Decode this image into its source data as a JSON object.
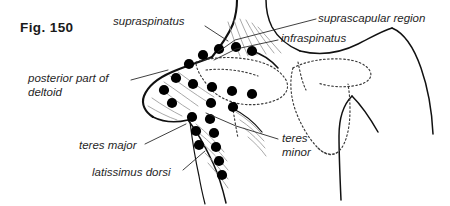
{
  "figure": {
    "caption": "Fig. 150",
    "style": {
      "ink": "#111111",
      "background": "#ffffff",
      "dot_color": "#000000",
      "muscle_fiber_color": "#8d8d8d",
      "dotted_outline_color": "#3a3a3a"
    }
  },
  "annotations": [
    {
      "id": "supraspinatus",
      "label": "supraspinatus",
      "lines": [
        "supraspinatus"
      ],
      "text_x": 113,
      "text_y": 15,
      "leader": [
        [
          205,
          26
        ],
        [
          228,
          41
        ]
      ]
    },
    {
      "id": "suprascapular-region",
      "label": "suprascapular region",
      "lines": [
        "suprascapular region"
      ],
      "text_x": 318,
      "text_y": 12,
      "leader": [
        [
          316,
          19
        ],
        [
          235,
          40
        ],
        [
          218,
          52
        ]
      ]
    },
    {
      "id": "infraspinatus",
      "label": "infraspinatus",
      "lines": [
        "infraspinatus"
      ],
      "text_x": 281,
      "text_y": 32,
      "leader": [
        [
          278,
          40
        ],
        [
          236,
          49
        ],
        [
          214,
          60
        ]
      ]
    },
    {
      "id": "posterior-part-of-deltoid",
      "label": "posterior part of deltoid",
      "lines": [
        "posterior part of",
        "deltoid"
      ],
      "text_x": 28,
      "text_y": 72,
      "leader": [
        [
          131,
          80
        ],
        [
          168,
          70
        ]
      ]
    },
    {
      "id": "teres-major",
      "label": "teres major",
      "lines": [
        "teres major"
      ],
      "text_x": 79,
      "text_y": 139,
      "leader": [
        [
          145,
          144
        ],
        [
          186,
          124
        ]
      ]
    },
    {
      "id": "latissimus-dorsi",
      "label": "latissimus dorsi",
      "lines": [
        "latissimus dorsi"
      ],
      "text_x": 92,
      "text_y": 166,
      "leader": [
        [
          183,
          170
        ],
        [
          205,
          151
        ]
      ]
    },
    {
      "id": "teres-minor",
      "label": "teres minor",
      "lines": [
        "teres",
        "minor"
      ],
      "text_x": 282,
      "text_y": 132,
      "leader": [
        [
          278,
          139
        ],
        [
          236,
          126
        ],
        [
          206,
          113
        ]
      ]
    }
  ],
  "trigger_points": {
    "radius": 5.1,
    "supraspinatus_row": [
      {
        "x": 189,
        "y": 64
      },
      {
        "x": 203,
        "y": 55
      },
      {
        "x": 219,
        "y": 49
      },
      {
        "x": 236,
        "y": 47
      },
      {
        "x": 252,
        "y": 51
      }
    ],
    "deltoid_cluster": [
      {
        "x": 176,
        "y": 78
      },
      {
        "x": 164,
        "y": 90
      },
      {
        "x": 172,
        "y": 103
      },
      {
        "x": 193,
        "y": 84
      },
      {
        "x": 212,
        "y": 87
      },
      {
        "x": 232,
        "y": 91
      },
      {
        "x": 252,
        "y": 94
      },
      {
        "x": 233,
        "y": 107
      },
      {
        "x": 211,
        "y": 103
      }
    ],
    "teres_latissimus_column": [
      {
        "x": 192,
        "y": 117
      },
      {
        "x": 210,
        "y": 119
      },
      {
        "x": 196,
        "y": 131
      },
      {
        "x": 214,
        "y": 133
      },
      {
        "x": 199,
        "y": 145
      },
      {
        "x": 216,
        "y": 147
      },
      {
        "x": 219,
        "y": 161
      },
      {
        "x": 222,
        "y": 175
      }
    ]
  },
  "body_outlines": {
    "neck_and_shoulder": "neck-shoulder-contour",
    "left_scapula_dotted": "left-scapula-dotted-outline",
    "right_scapula_dotted": "right-scapula-dotted-outline",
    "right_arm_contour": "right-arm-contour",
    "trunk_contour": "trunk-contour"
  }
}
